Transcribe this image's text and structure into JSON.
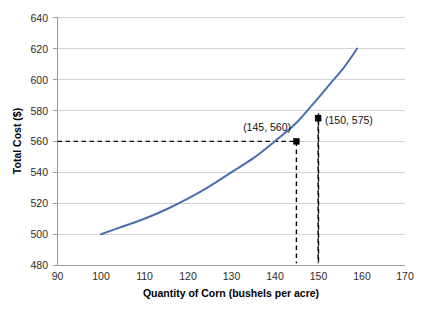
{
  "chart_data": {
    "type": "line",
    "title": "",
    "xlabel": "Quantity of Corn (bushels per acre)",
    "ylabel": "Total Cost ($)",
    "xlim": [
      90,
      170
    ],
    "ylim": [
      480,
      640
    ],
    "xticks": [
      "90",
      "100",
      "110",
      "120",
      "130",
      "140",
      "150",
      "160",
      "170"
    ],
    "yticks": [
      "480",
      "500",
      "520",
      "540",
      "560",
      "580",
      "600",
      "620",
      "640"
    ],
    "grid": "horizontal",
    "legend": "none",
    "series": [
      {
        "name": "Total Cost",
        "color": "#4A6FB0",
        "x": [
          100,
          105,
          110,
          115,
          120,
          125,
          130,
          135,
          140,
          145,
          150,
          153,
          156,
          159
        ],
        "values": [
          500,
          505,
          510,
          516,
          523,
          531,
          540,
          549,
          560,
          572,
          588,
          598,
          608,
          620
        ]
      }
    ],
    "annotations": [
      {
        "label": "(145, 560)",
        "x": 145,
        "y": 560,
        "marker": "square-black",
        "label_anchor": "end"
      },
      {
        "label": "(150, 575)",
        "x": 150,
        "y": 575,
        "marker": "square-black",
        "label_anchor": "start"
      }
    ],
    "guides": [
      {
        "type": "horizontal",
        "y": 575,
        "from_x": 90,
        "to_x": 150,
        "style": "dashed"
      },
      {
        "type": "horizontal",
        "y": 560,
        "from_x": 90,
        "to_x": 145,
        "style": "dashed"
      },
      {
        "type": "vertical",
        "x": 145,
        "from_y": 480,
        "to_y": 560,
        "style": "dashed"
      },
      {
        "type": "vertical",
        "x": 150,
        "from_y": 480,
        "to_y": 575,
        "style": "dashed"
      }
    ]
  }
}
